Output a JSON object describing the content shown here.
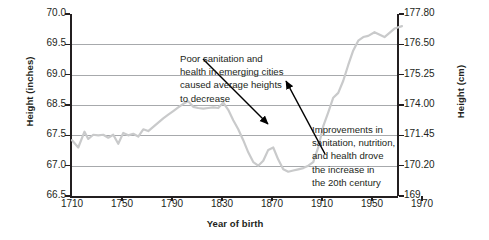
{
  "chart_data": {
    "type": "line",
    "title": "",
    "xlabel": "Year of birth",
    "ylabel": "Height (inches)",
    "ylabel_right": "Height (cm)",
    "xlim": [
      1710,
      1970
    ],
    "ylim": [
      66.5,
      70.0
    ],
    "grid": true,
    "legend": "none",
    "xticks": [
      "1710",
      "1750",
      "1790",
      "1830",
      "1870",
      "1910",
      "1950",
      "1970"
    ],
    "xtick_values": [
      1710,
      1750,
      1790,
      1830,
      1870,
      1910,
      1950,
      1970
    ],
    "yticks_left": [
      "70.0",
      "69.5",
      "69.0",
      "68.5",
      "67.5",
      "67.0",
      "66.5"
    ],
    "ytick_values_left": [
      70.0,
      69.5,
      69.0,
      68.5,
      67.5,
      67.0,
      66.5
    ],
    "yticks_right": [
      "177.80",
      "176.50",
      "175.25",
      "174.00",
      "171.45",
      "170.20",
      "169"
    ],
    "ytick_values_right": [
      177.8,
      176.5,
      175.25,
      174.0,
      171.45,
      170.2,
      169
    ],
    "series": [
      {
        "name": "Average male height by year of birth",
        "color": "#c9cacb",
        "x": [
          1710,
          1715,
          1720,
          1723,
          1727,
          1731,
          1735,
          1739,
          1743,
          1747,
          1751,
          1755,
          1759,
          1763,
          1767,
          1771,
          1775,
          1779,
          1783,
          1787,
          1791,
          1795,
          1799,
          1803,
          1807,
          1811,
          1815,
          1819,
          1823,
          1827,
          1831,
          1835,
          1839,
          1843,
          1847,
          1851,
          1855,
          1859,
          1863,
          1867,
          1871,
          1875,
          1879,
          1883,
          1887,
          1891,
          1895,
          1899,
          1903,
          1907,
          1911,
          1915,
          1919,
          1923,
          1927,
          1931,
          1935,
          1939,
          1943,
          1947,
          1951,
          1955,
          1959,
          1962
        ],
        "y": [
          67.42,
          67.3,
          67.62,
          67.44,
          67.52,
          67.5,
          67.52,
          67.46,
          67.52,
          67.36,
          67.58,
          67.5,
          67.55,
          67.48,
          67.7,
          67.64,
          67.78,
          67.92,
          68.06,
          68.18,
          68.3,
          68.42,
          68.52,
          68.56,
          68.44,
          68.4,
          68.38,
          68.4,
          68.42,
          68.4,
          68.54,
          68.34,
          68.0,
          67.7,
          67.42,
          67.22,
          67.06,
          67.0,
          67.08,
          67.26,
          67.3,
          67.1,
          66.94,
          66.9,
          66.92,
          66.94,
          66.96,
          67.0,
          67.06,
          67.3,
          67.8,
          68.26,
          68.62,
          68.7,
          68.9,
          69.16,
          69.4,
          69.56,
          69.62,
          69.64,
          69.7,
          69.62,
          69.76,
          69.8
        ]
      }
    ],
    "annotations": [
      {
        "id": "annotation-1",
        "text": "Poor sanitation and health in emerging cities caused average heights to decrease",
        "lines": [
          "Poor sanitation and",
          "health in emerging cities",
          "caused average heights",
          "to decrease"
        ],
        "points_to_year": 1843,
        "points_to_value": 68.0
      },
      {
        "id": "annotation-2",
        "text": "Improvements in sanitation, nutrition, and health drove the increase in the 20th century",
        "lines": [
          "Improvements in",
          "sanitation, nutrition,",
          "and health drove",
          "the increase in",
          "the 20th century"
        ],
        "points_to_year": 1925,
        "points_to_value": 69.1
      }
    ]
  },
  "colors": {
    "line": "#c9cacb",
    "grid": "#a7a9ac",
    "axis": "#231f20",
    "text": "#231f20",
    "arrow": "#000000",
    "background": "#ffffff"
  }
}
